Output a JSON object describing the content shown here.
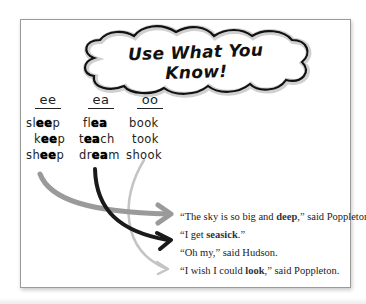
{
  "title": "Use What You Know!",
  "columns": [
    {
      "id": "ee",
      "heading": "ee",
      "words": [
        {
          "pre": "sl",
          "hl": "ee",
          "post": "p"
        },
        {
          "pre": "k",
          "hl": "ee",
          "post": "p"
        },
        {
          "pre": "sh",
          "hl": "ee",
          "post": "p"
        }
      ]
    },
    {
      "id": "ea",
      "heading": "ea",
      "words": [
        {
          "pre": "fl",
          "hl": "ea",
          "post": ""
        },
        {
          "pre": "t",
          "hl": "ea",
          "post": "ch"
        },
        {
          "pre": "dr",
          "hl": "ea",
          "post": "m"
        }
      ]
    },
    {
      "id": "oo",
      "heading": "oo",
      "words": [
        {
          "pre": "b",
          "hl": "oo",
          "post": "k"
        },
        {
          "pre": "t",
          "hl": "oo",
          "post": "k"
        },
        {
          "pre": "sh",
          "hl": "oo",
          "post": "k"
        }
      ]
    }
  ],
  "sentences": [
    {
      "pre": "“The sky is so big and ",
      "hl": "deep",
      "post": ",” said Poppleton."
    },
    {
      "pre": "“I get ",
      "hl": "seasick",
      "post": ".”"
    },
    {
      "pre": "“Oh my,” said Hudson.",
      "hl": "",
      "post": ""
    },
    {
      "pre": "“I wish I could ",
      "hl": "look",
      "post": ",” said Poppleton."
    }
  ],
  "arrows": [
    {
      "from": "sheep",
      "to_sentence": 0,
      "target_word": "deep",
      "color": "#9a9a9a"
    },
    {
      "from": "dream",
      "to_sentence": 1,
      "target_word": "seasick",
      "color": "#1a1a1a"
    },
    {
      "from": "shook",
      "to_sentence": 3,
      "target_word": "look",
      "color": "#c4c4c4"
    }
  ],
  "colors": {
    "card_border": "#9a9a9a",
    "cloud_outline": "#111111",
    "cloud_inner_shadow": "#cfcfcf",
    "text": "#222222"
  }
}
